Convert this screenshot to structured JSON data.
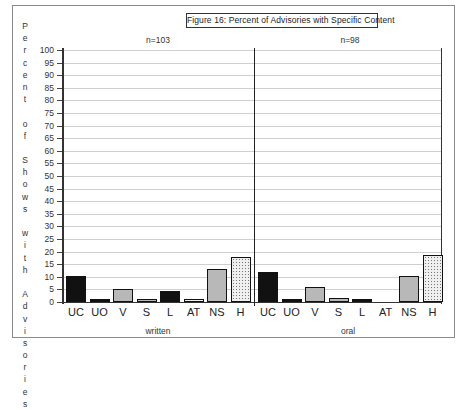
{
  "chart_data": {
    "type": "bar",
    "title": "Figure 16:  Percent of Advisories with Specific Content",
    "ylabel": "Percent of Shows with Advisories",
    "xlabel": "",
    "ylim": [
      0,
      100
    ],
    "yticks": [
      0,
      5,
      10,
      15,
      20,
      25,
      30,
      35,
      40,
      45,
      50,
      55,
      60,
      65,
      70,
      75,
      80,
      85,
      90,
      95,
      100
    ],
    "grid": true,
    "legend": null,
    "categories": [
      "UC",
      "UO",
      "V",
      "S",
      "L",
      "AT",
      "NS",
      "H"
    ],
    "panels": [
      {
        "name": "written",
        "n_label": "n=103",
        "values": [
          10.5,
          1,
          5,
          1,
          4.5,
          1,
          13,
          18
        ]
      },
      {
        "name": "oral",
        "n_label": "n=98",
        "values": [
          12,
          1,
          6,
          1.5,
          1,
          0,
          10.5,
          18.5
        ]
      }
    ],
    "series": [
      {
        "name": "written",
        "values": [
          10.5,
          1,
          5,
          1,
          4.5,
          1,
          13,
          18
        ]
      },
      {
        "name": "oral",
        "values": [
          12,
          1,
          6,
          1.5,
          1,
          0,
          10.5,
          18.5
        ]
      }
    ],
    "bar_fills": {
      "UC": "#111111",
      "UO": "#111111",
      "V": "#b8b8b8",
      "S": "#b8b8b8",
      "L": "#111111",
      "AT": "dotted",
      "NS": "#b8b8b8",
      "H": "dotted"
    }
  },
  "title": "Figure 16:  Percent of Advisories with Specific Content",
  "ylabel_letters": [
    "P",
    "e",
    "r",
    "c",
    "e",
    "n",
    "t",
    "",
    "o",
    "f",
    "",
    "S",
    "h",
    "o",
    "w",
    "s",
    "",
    "w",
    "i",
    "t",
    "h",
    "",
    "A",
    "d",
    "v",
    "i",
    "s",
    "o",
    "r",
    "i",
    "e",
    "s"
  ]
}
